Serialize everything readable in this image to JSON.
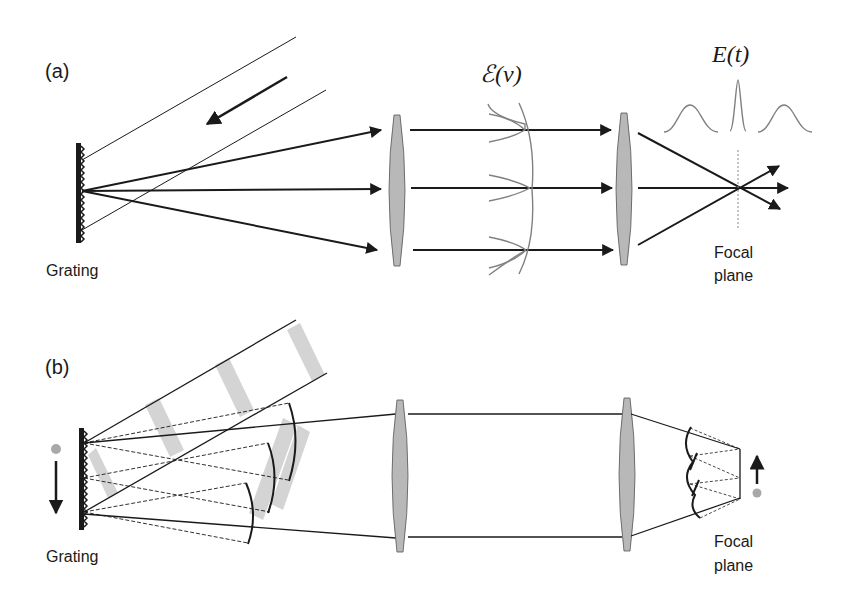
{
  "figure": {
    "panel_a": {
      "label": "(a)",
      "grating_label": "Grating",
      "spectrum_label": "ℰ(ν)",
      "time_label": "E(t)",
      "focal_label_line1": "Focal",
      "focal_label_line2": "plane"
    },
    "panel_b": {
      "label": "(b)",
      "grating_label": "Grating",
      "focal_label_line1": "Focal",
      "focal_label_line2": "plane"
    }
  },
  "colors": {
    "line": "#1a1a1a",
    "lens_fill": "#b8b8b8",
    "curve_gray": "#808080",
    "band_gray": "#d4d4d4",
    "dot_gray": "#a8a8a8"
  }
}
